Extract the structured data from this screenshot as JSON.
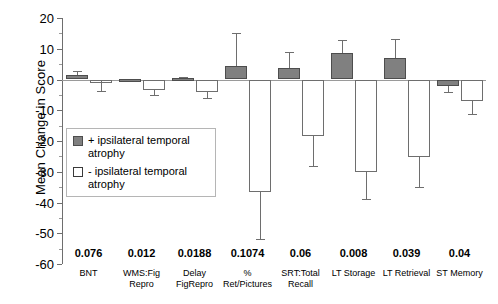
{
  "chart_data": {
    "type": "bar",
    "title": "",
    "xlabel": "",
    "ylabel": "Mean Change in Score",
    "ylim": [
      -60,
      20
    ],
    "yticks": [
      20,
      10,
      0,
      -10,
      -20,
      -30,
      -40,
      -50,
      -60
    ],
    "ytick_labels": [
      "20",
      "10",
      "0",
      "-10",
      "-20",
      "-30",
      "-40",
      "-50",
      "-60"
    ],
    "grid": false,
    "legend_position": "inside-left",
    "categories": [
      "BNT",
      "WMS:Fig Repro",
      "Delay FigRepro",
      "% Ret/Pictures",
      "SRT:Total Recall",
      "LT Storage",
      "LT Retrieval",
      "ST Memory"
    ],
    "category_lines": [
      [
        "BNT"
      ],
      [
        "WMS:Fig",
        "Repro"
      ],
      [
        "Delay",
        "FigRepro"
      ],
      [
        "%",
        "Ret/Pictures"
      ],
      [
        "SRT:Total",
        "Recall"
      ],
      [
        "LT Storage"
      ],
      [
        "LT Retrieval"
      ],
      [
        "ST Memory"
      ]
    ],
    "p_values": [
      "0.076",
      "0.012",
      "0.0188",
      "0.1074",
      "0.06",
      "0.008",
      "0.039",
      "0.04"
    ],
    "series": [
      {
        "name": "+ ipsilateral temporal atrophy",
        "style": "filled",
        "color": "#808080",
        "values": [
          1.5,
          0.3,
          0.6,
          4.5,
          3.6,
          8.6,
          7.0,
          -2.0
        ],
        "errors_upper": [
          2.8,
          0.3,
          0.9,
          15.0,
          9.0,
          13.0,
          13.2,
          0.0
        ],
        "errors_lower": [
          0.0,
          0.0,
          0.0,
          0.0,
          0.0,
          0.0,
          0.0,
          -4.2
        ]
      },
      {
        "name": "- ipsilateral temporal atrophy",
        "style": "open",
        "color": "#ffffff",
        "values": [
          -0.6,
          -3.5,
          -4.2,
          -36.5,
          -18.5,
          -30.0,
          -25.2,
          -7.0
        ],
        "errors_lower": [
          -3.6,
          -5.2,
          -6.0,
          -51.8,
          -28.2,
          -39.0,
          -35.0,
          -11.2
        ]
      }
    ],
    "legend": [
      {
        "marker": "filled",
        "label_line1": "+ ipsilateral temporal",
        "label_line2": "atrophy"
      },
      {
        "marker": "open",
        "label_line1": "- ipsilateral temporal",
        "label_line2": "atrophy"
      }
    ],
    "colors": {
      "filled_fill": "#808080",
      "filled_stroke": "#4d4d4d",
      "open_fill": "#ffffff",
      "open_stroke": "#6e6e6e",
      "axis": "#6e6e6e",
      "text": "#000000",
      "background": "#ffffff"
    }
  }
}
